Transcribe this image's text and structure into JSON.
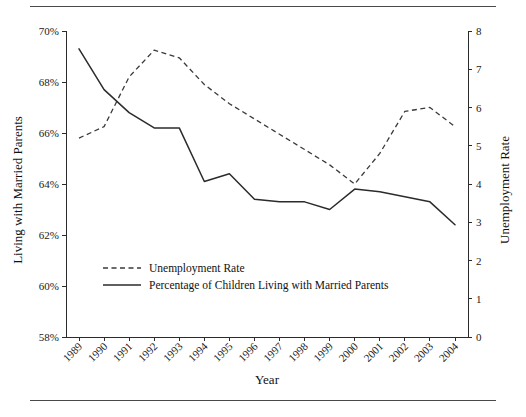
{
  "chart_data": {
    "type": "line",
    "title": "",
    "xlabel": "Year",
    "ylabel": "Living with Married Parents",
    "y2label": "Unemployment Rate",
    "categories": [
      "1989",
      "1990",
      "1991",
      "1992",
      "1993",
      "1994",
      "1995",
      "1996",
      "1997",
      "1998",
      "1999",
      "2000",
      "2001",
      "2002",
      "2003",
      "2004"
    ],
    "ylim": [
      58,
      70
    ],
    "y2lim": [
      0,
      8
    ],
    "yticks": [
      "58%",
      "60%",
      "62%",
      "64%",
      "66%",
      "68%",
      "70%"
    ],
    "ytick_values": [
      58,
      60,
      62,
      64,
      66,
      68,
      70
    ],
    "y2ticks": [
      "0",
      "1",
      "2",
      "3",
      "4",
      "5",
      "6",
      "7",
      "8"
    ],
    "y2tick_values": [
      0,
      1,
      2,
      3,
      4,
      5,
      6,
      7,
      8
    ],
    "grid": false,
    "legend_position": "lower-left-inside",
    "series": [
      {
        "name": "Unemployment Rate",
        "axis": "right",
        "style": "dashed",
        "color": "#3a3a3a",
        "values": [
          5.2,
          5.5,
          6.8,
          7.5,
          7.3,
          6.6,
          6.1,
          5.7,
          5.3,
          4.9,
          4.5,
          4.0,
          4.8,
          5.9,
          6.0,
          5.5
        ]
      },
      {
        "name": "Percentage of Children Living with Married Parents",
        "axis": "left",
        "style": "solid",
        "color": "#2b2b2b",
        "values": [
          69.3,
          67.7,
          66.8,
          66.2,
          66.2,
          64.1,
          64.4,
          63.4,
          63.3,
          63.3,
          63.0,
          63.8,
          63.7,
          63.5,
          63.3,
          62.4
        ]
      }
    ],
    "legend": [
      {
        "label": "Unemployment Rate",
        "style": "dashed"
      },
      {
        "label": "Percentage of Children Living with Married Parents",
        "style": "solid"
      }
    ]
  }
}
